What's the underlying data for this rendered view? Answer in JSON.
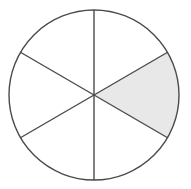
{
  "figure": {
    "shape": "circle",
    "center_x": 94,
    "center_y": 95,
    "radius": 85,
    "total_sectors": 6,
    "shaded_sectors": 1,
    "unshaded_sectors": 5,
    "sector_angle_degrees": 60,
    "fraction_shaded": "1/6",
    "colors": {
      "shaded_fill": "#e8e8e8",
      "unshaded_fill": "#ffffff",
      "outline_stroke": "#4a4a4a",
      "divider_stroke": "#4a4a4a",
      "background": "#ffffff"
    },
    "stroke_width": 1.4
  },
  "chart_data": {
    "type": "pie",
    "title": "",
    "categories": [
      "sector-1",
      "sector-2",
      "sector-3",
      "sector-4",
      "sector-5",
      "sector-6"
    ],
    "values": [
      60,
      60,
      60,
      60,
      60,
      60
    ],
    "shaded": [
      true,
      false,
      false,
      false,
      false,
      false
    ],
    "legend": "none",
    "sectors": [
      {
        "name": "sector-right",
        "start_deg": -30,
        "end_deg": 30,
        "shaded": true,
        "fill": "#e8e8e8"
      },
      {
        "name": "sector-upper-right",
        "start_deg": -90,
        "end_deg": -30,
        "shaded": false,
        "fill": "#ffffff"
      },
      {
        "name": "sector-upper-left",
        "start_deg": -150,
        "end_deg": -90,
        "shaded": false,
        "fill": "#ffffff"
      },
      {
        "name": "sector-left",
        "start_deg": 150,
        "end_deg": 210,
        "shaded": false,
        "fill": "#ffffff"
      },
      {
        "name": "sector-lower-left",
        "start_deg": 90,
        "end_deg": 150,
        "shaded": false,
        "fill": "#ffffff"
      },
      {
        "name": "sector-lower-right",
        "start_deg": 30,
        "end_deg": 90,
        "shaded": false,
        "fill": "#ffffff"
      }
    ],
    "dividers": [
      {
        "name": "vertical-diameter",
        "angle_deg": 90,
        "x1": 94,
        "y1": 10,
        "x2": 94,
        "y2": 180
      },
      {
        "name": "diagonal-diameter-up",
        "angle_deg": 30,
        "x1": 20,
        "y1": 52,
        "x2": 168,
        "y2": 138
      },
      {
        "name": "diagonal-diameter-down",
        "angle_deg": -30,
        "x1": 20,
        "y1": 138,
        "x2": 168,
        "y2": 52
      }
    ]
  }
}
